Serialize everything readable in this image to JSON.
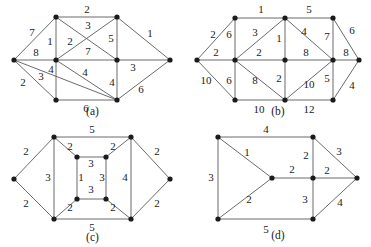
{
  "figure": {
    "title_visible": false,
    "panel_count": 4,
    "style": {
      "edge_color": "#5a5a5a",
      "vertex_color": "#1b1b1b",
      "label_color": "#1a1a1a",
      "background": "#ffffff"
    }
  },
  "panels": [
    {
      "id": "a",
      "caption": "(a)",
      "vertex_count": 8,
      "edge_count": 15,
      "weights": [
        "7",
        "2",
        "3",
        "1",
        "2",
        "5",
        "1",
        "8",
        "7",
        "3",
        "2",
        "3",
        "4",
        "4",
        "4",
        "6",
        "6"
      ],
      "weight_labels": {
        "left_top": "7",
        "top": "2",
        "top_diag": "3",
        "tl_ml": "1",
        "ml_tr_diag": "2",
        "tr_mr": "5",
        "right_top": "1",
        "left_mid": "8",
        "mid": "7",
        "left_bl_diag": "3",
        "left_bottom": "2",
        "mr_right": "3",
        "ml_bl": "4",
        "bottom_diag": "4",
        "mr_br": "4",
        "bottom": "6",
        "right_bottom": "6"
      }
    },
    {
      "id": "b",
      "caption": "(b)",
      "vertex_count": 10,
      "edge_count": 19,
      "weights": [
        "2",
        "1",
        "5",
        "6",
        "6",
        "3",
        "4",
        "7",
        "2",
        "2",
        "8",
        "8",
        "10",
        "6",
        "8",
        "2",
        "10",
        "5",
        "4",
        "10",
        "12"
      ],
      "weight_labels": {
        "left_top": "2",
        "top_left_seg": "1",
        "top_right_seg": "5",
        "tr_right_diag": "6",
        "tl_ml": "6",
        "tl_mc_diag": "3",
        "tc_mr_diag": "4",
        "tr_mr": "7",
        "ml_mc": "2",
        "left_mid": "2",
        "tc_mc": "1",
        "mc_mr": "8",
        "mr_right": "8",
        "left_bottom": "10",
        "ml_bl": "6",
        "ml_bc_diag": "8",
        "mc_bc": "2",
        "mc_br_diag": "10",
        "mr_br": "5",
        "bottom_left_seg": "10",
        "bottom_right_seg": "12",
        "br_right": "4"
      }
    },
    {
      "id": "c",
      "caption": "(c)",
      "vertex_count": 10,
      "edge_count": 13,
      "weights": [
        "5",
        "2",
        "2",
        "2",
        "2",
        "2",
        "2",
        "3",
        "3",
        "1",
        "3",
        "4",
        "5",
        "2",
        "2"
      ],
      "weight_labels": {
        "top": "5",
        "left_top": "2",
        "left_bottom": "2",
        "right_top": "2",
        "right_bottom": "2",
        "tl_itl": "2",
        "tr_itr": "2",
        "left_col": "3",
        "inner_top": "3",
        "inner_left": "1",
        "inner_right": "3",
        "right_col": "4",
        "inner_bottom": "3",
        "bl_ibl": "2",
        "br_ibr": "2",
        "bottom": "5"
      }
    },
    {
      "id": "d",
      "caption": "(d)",
      "vertex_count": 7,
      "edge_count": 10,
      "weights": [
        "4",
        "1",
        "3",
        "2",
        "2",
        "2",
        "3",
        "2",
        "3",
        "4",
        "5"
      ],
      "weight_labels": {
        "top": "4",
        "tl_center_diag": "1",
        "left_col": "3",
        "tc_mc": "2",
        "tc_right_diag": "3",
        "center_mc": "2",
        "mc_right": "2",
        "bl_center_diag": "2",
        "mc_bc": "3",
        "bc_right_diag": "4",
        "bottom": "5"
      }
    }
  ]
}
